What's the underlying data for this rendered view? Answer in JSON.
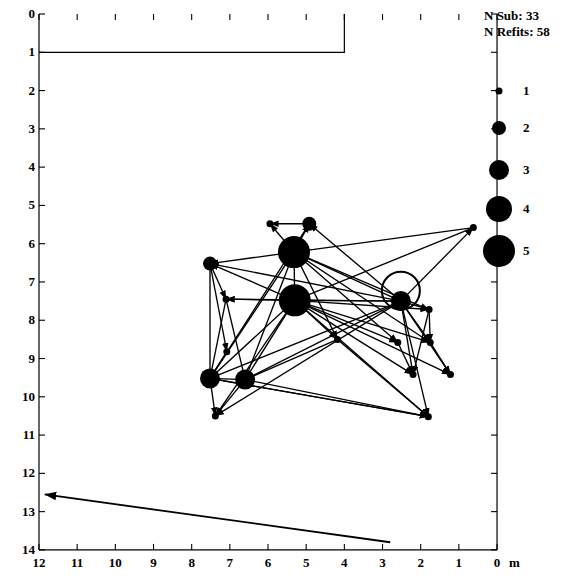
{
  "figure": {
    "unit_label": "m",
    "stats": {
      "n_sub_label": "N Sub:",
      "n_sub_value": "33",
      "n_refits_label": "N Refits:",
      "n_refits_value": "58"
    }
  },
  "axes": {
    "x": {
      "ticks": [
        12,
        11,
        10,
        9,
        8,
        7,
        6,
        5,
        4,
        3,
        2,
        1,
        0
      ],
      "min": 0,
      "max": 12,
      "reversed": true,
      "unit": "m"
    },
    "y": {
      "ticks": [
        0,
        1,
        2,
        3,
        4,
        5,
        6,
        7,
        8,
        9,
        10,
        11,
        12,
        13,
        14
      ],
      "min": 0,
      "max": 14,
      "inverted": true
    }
  },
  "legend": {
    "title": "",
    "entries": [
      {
        "label": "1",
        "size": 1,
        "diameter_px": 7
      },
      {
        "label": "2",
        "size": 2,
        "diameter_px": 14
      },
      {
        "label": "3",
        "size": 3,
        "diameter_px": 20
      },
      {
        "label": "4",
        "size": 4,
        "diameter_px": 26
      },
      {
        "label": "5",
        "size": 5,
        "diameter_px": 32
      }
    ]
  },
  "north_arrow": {
    "name": "north-arrow",
    "from": {
      "x": 2.8,
      "y": 13.8
    },
    "to": {
      "x": 11.85,
      "y": 12.55
    }
  },
  "excavation_outline": {
    "description": "stepped excavation boundary at top of plot",
    "points": [
      {
        "x": 12,
        "y": 1.0
      },
      {
        "x": 4.0,
        "y": 1.0
      },
      {
        "x": 4.0,
        "y": 0.0
      }
    ]
  },
  "chart_data": {
    "type": "scatter",
    "title": "",
    "xlabel": "m",
    "ylabel": "",
    "xlim": [
      12,
      0
    ],
    "ylim": [
      14,
      0
    ],
    "grid": false,
    "legend_position": "right",
    "size_scale_label": "Number of refits per node (1-5)",
    "nodes": [
      {
        "id": 1,
        "x": 5.95,
        "y": 5.48,
        "size": 1
      },
      {
        "id": 2,
        "x": 4.92,
        "y": 5.48,
        "size": 2
      },
      {
        "id": 3,
        "x": 0.62,
        "y": 5.58,
        "size": 1
      },
      {
        "id": 4,
        "x": 7.52,
        "y": 6.52,
        "size": 2
      },
      {
        "id": 5,
        "x": 5.32,
        "y": 6.22,
        "size": 5
      },
      {
        "id": 6,
        "x": 5.3,
        "y": 7.48,
        "size": 5
      },
      {
        "id": 7,
        "x": 7.1,
        "y": 7.45,
        "size": 1
      },
      {
        "id": 8,
        "x": 2.52,
        "y": 7.5,
        "size": 3
      },
      {
        "id": 9,
        "x": 1.78,
        "y": 7.72,
        "size": 1
      },
      {
        "id": 10,
        "x": 4.18,
        "y": 8.5,
        "size": 1
      },
      {
        "id": 11,
        "x": 2.6,
        "y": 8.58,
        "size": 1
      },
      {
        "id": 12,
        "x": 1.75,
        "y": 8.58,
        "size": 1
      },
      {
        "id": 13,
        "x": 7.08,
        "y": 8.82,
        "size": 1
      },
      {
        "id": 14,
        "x": 2.2,
        "y": 9.42,
        "size": 1
      },
      {
        "id": 15,
        "x": 1.22,
        "y": 9.42,
        "size": 1
      },
      {
        "id": 16,
        "x": 7.52,
        "y": 9.52,
        "size": 3
      },
      {
        "id": 17,
        "x": 6.6,
        "y": 9.55,
        "size": 3
      },
      {
        "id": 18,
        "x": 7.38,
        "y": 10.5,
        "size": 1
      },
      {
        "id": 19,
        "x": 1.8,
        "y": 10.52,
        "size": 1
      }
    ],
    "links": [
      {
        "from": 5,
        "to": 2,
        "arrow": true
      },
      {
        "from": 5,
        "to": 1,
        "arrow": true
      },
      {
        "from": 2,
        "to": 1,
        "arrow": true
      },
      {
        "from": 5,
        "to": 6,
        "arrow": true
      },
      {
        "from": 5,
        "to": 8,
        "arrow": true
      },
      {
        "from": 5,
        "to": 9,
        "arrow": true
      },
      {
        "from": 5,
        "to": 16,
        "arrow": true
      },
      {
        "from": 5,
        "to": 17,
        "arrow": true
      },
      {
        "from": 5,
        "to": 4,
        "arrow": true
      },
      {
        "from": 5,
        "to": 10,
        "arrow": true
      },
      {
        "from": 5,
        "to": 11,
        "arrow": true
      },
      {
        "from": 5,
        "to": 12,
        "arrow": true
      },
      {
        "from": 6,
        "to": 8,
        "arrow": true
      },
      {
        "from": 6,
        "to": 9,
        "arrow": true
      },
      {
        "from": 6,
        "to": 10,
        "arrow": true
      },
      {
        "from": 6,
        "to": 11,
        "arrow": true
      },
      {
        "from": 6,
        "to": 12,
        "arrow": true
      },
      {
        "from": 6,
        "to": 14,
        "arrow": true
      },
      {
        "from": 6,
        "to": 15,
        "arrow": true
      },
      {
        "from": 6,
        "to": 16,
        "arrow": true
      },
      {
        "from": 6,
        "to": 17,
        "arrow": true
      },
      {
        "from": 6,
        "to": 18,
        "arrow": true
      },
      {
        "from": 6,
        "to": 19,
        "arrow": true
      },
      {
        "from": 6,
        "to": 4,
        "arrow": true
      },
      {
        "from": 6,
        "to": 7,
        "arrow": true
      },
      {
        "from": 8,
        "to": 3,
        "arrow": true
      },
      {
        "from": 8,
        "to": 16,
        "arrow": true
      },
      {
        "from": 8,
        "to": 17,
        "arrow": true
      },
      {
        "from": 8,
        "to": 9,
        "arrow": true
      },
      {
        "from": 8,
        "to": 12,
        "arrow": true
      },
      {
        "from": 8,
        "to": 14,
        "arrow": true
      },
      {
        "from": 8,
        "to": 15,
        "arrow": true
      },
      {
        "from": 8,
        "to": 18,
        "arrow": true
      },
      {
        "from": 8,
        "to": 19,
        "arrow": true
      },
      {
        "from": 8,
        "to": 4,
        "arrow": true
      },
      {
        "from": 8,
        "to": 7,
        "arrow": true
      },
      {
        "from": 8,
        "to": 2,
        "arrow": true
      },
      {
        "from": 4,
        "to": 7,
        "arrow": true
      },
      {
        "from": 4,
        "to": 13,
        "arrow": true
      },
      {
        "from": 4,
        "to": 16,
        "arrow": true
      },
      {
        "from": 7,
        "to": 17,
        "arrow": true
      },
      {
        "from": 7,
        "to": 16,
        "arrow": true
      },
      {
        "from": 13,
        "to": 16,
        "arrow": true
      },
      {
        "from": 16,
        "to": 17,
        "arrow": true
      },
      {
        "from": 16,
        "to": 18,
        "arrow": true
      },
      {
        "from": 17,
        "to": 18,
        "arrow": true
      },
      {
        "from": 17,
        "to": 19,
        "arrow": true
      },
      {
        "from": 16,
        "to": 19,
        "arrow": true
      },
      {
        "from": 9,
        "to": 14,
        "arrow": true
      },
      {
        "from": 9,
        "to": 12,
        "arrow": true
      },
      {
        "from": 12,
        "to": 15,
        "arrow": true
      },
      {
        "from": 11,
        "to": 14,
        "arrow": true
      },
      {
        "from": 10,
        "to": 19,
        "arrow": true
      },
      {
        "from": 10,
        "to": 17,
        "arrow": true
      },
      {
        "from": 3,
        "to": 5,
        "arrow": true
      },
      {
        "from": 3,
        "to": 6,
        "arrow": true
      },
      {
        "from": 19,
        "to": 16,
        "arrow": true
      },
      {
        "from": 2,
        "to": 16,
        "arrow": true
      }
    ],
    "self_loops": [
      {
        "node": 8,
        "radius_px": 19
      }
    ]
  }
}
